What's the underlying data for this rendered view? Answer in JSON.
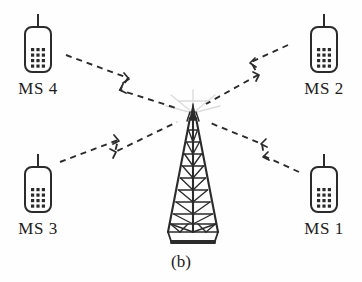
{
  "figure": {
    "caption": "(b)",
    "type": "cellular-network-multipath-diagram",
    "background_color": "#fefefe",
    "ink_color": "#2b2b2b",
    "faint_color": "#d9d9d9"
  },
  "base_station": {
    "name": "base-station-tower",
    "icon": "lattice-tower-icon",
    "label": "",
    "tip_burst": "antenna-radiation-burst",
    "rung_count": 10,
    "position": {
      "x": 193,
      "y": 172
    }
  },
  "mobile_stations": [
    {
      "id": "ms1",
      "label": "MS 1",
      "icon": "mobile-phone-icon",
      "corner": "bottom-right",
      "keypad_rows": 4,
      "keypad_cols": 3
    },
    {
      "id": "ms2",
      "label": "MS 2",
      "icon": "mobile-phone-icon",
      "corner": "top-right",
      "keypad_rows": 4,
      "keypad_cols": 3
    },
    {
      "id": "ms3",
      "label": "MS 3",
      "icon": "mobile-phone-icon",
      "corner": "bottom-left",
      "keypad_rows": 4,
      "keypad_cols": 3
    },
    {
      "id": "ms4",
      "label": "MS 4",
      "icon": "mobile-phone-icon",
      "corner": "top-left",
      "keypad_rows": 4,
      "keypad_cols": 3
    }
  ],
  "signal_paths": [
    {
      "id": "path-ms4",
      "name": "signal-path-ms4",
      "from": "MS 4",
      "to": "base-station-tower",
      "style": "dashed-zigzag",
      "has_arrowhead": true
    },
    {
      "id": "path-ms2",
      "name": "signal-path-ms2",
      "from": "MS 2",
      "to": "base-station-tower",
      "style": "dashed-zigzag",
      "has_arrowhead": true
    },
    {
      "id": "path-ms3",
      "name": "signal-path-ms3",
      "from": "MS 3",
      "to": "base-station-tower",
      "style": "dashed-zigzag",
      "has_arrowhead": true
    },
    {
      "id": "path-ms1",
      "name": "signal-path-ms1",
      "from": "MS 1",
      "to": "base-station-tower",
      "style": "dashed-zigzag",
      "has_arrowhead": true
    }
  ]
}
